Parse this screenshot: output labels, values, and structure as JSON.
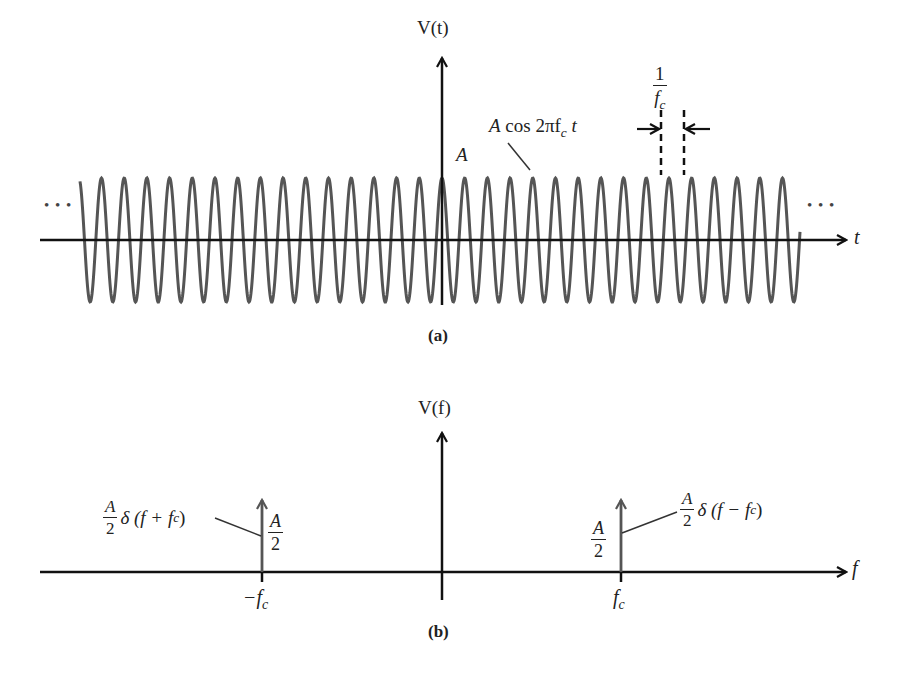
{
  "figure": {
    "panel_a": {
      "caption": "(a)",
      "y_axis_label": "V(t)",
      "x_axis_label": "t",
      "signal_label": {
        "amplitude": "A",
        "func": "cos 2πf",
        "sub": "c",
        "var": "t"
      },
      "peak_label": "A",
      "period_label": {
        "num": "1",
        "den": "f",
        "den_sub": "c"
      },
      "ellipsis_left": "• • •",
      "ellipsis_right": "• • •",
      "wave": {
        "center_x": 442,
        "axis_y": 240,
        "amplitude_px": 62,
        "period_px": 22.7,
        "x_start": 80,
        "x_end": 800,
        "color": "#555555"
      }
    },
    "panel_b": {
      "caption": "(b)",
      "y_axis_label": "V(f)",
      "x_axis_label": "f",
      "impulses": [
        {
          "position_label": "−f",
          "position_sub": "c",
          "height_label": {
            "num": "A",
            "den": "2"
          },
          "annotation": {
            "coef_num": "A",
            "coef_den": "2",
            "expr": "δ (f + f",
            "sub": "c",
            "close": ")"
          }
        },
        {
          "position_label": "f",
          "position_sub": "c",
          "height_label": {
            "num": "A",
            "den": "2"
          },
          "annotation": {
            "coef_num": "A",
            "coef_den": "2",
            "expr": "δ (f − f",
            "sub": "c",
            "close": ")"
          }
        }
      ]
    },
    "colors": {
      "axis": "#111111",
      "wave": "#555555",
      "impulse": "#555555",
      "text": "#222222",
      "background": "#ffffff"
    }
  }
}
